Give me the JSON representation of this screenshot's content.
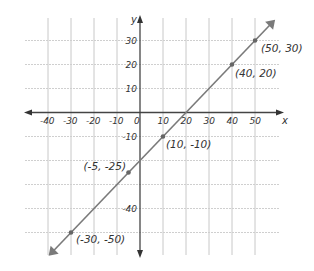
{
  "chart_data": {
    "type": "line",
    "title": "",
    "xlabel": "x",
    "ylabel": "y",
    "xlim": [
      -50,
      60
    ],
    "ylim": [
      -55,
      35
    ],
    "grid": true,
    "x_ticks": [
      -40,
      -30,
      -20,
      -10,
      0,
      10,
      20,
      30,
      40,
      50
    ],
    "x_tick_labels": [
      "-40",
      "-30",
      "-20",
      "-10",
      "0",
      "10",
      "20",
      "30",
      "40",
      "50"
    ],
    "y_ticks": [
      30,
      20,
      10,
      -10,
      -40
    ],
    "y_tick_labels": [
      "30",
      "20",
      "10",
      "-10",
      "-40"
    ],
    "series": [
      {
        "name": "line",
        "color": "#7a7a7a",
        "x": [
          -30,
          -5,
          10,
          40,
          50
        ],
        "y": [
          -50,
          -25,
          -10,
          20,
          30
        ]
      }
    ],
    "annotations": [
      {
        "text": "(50, 30)",
        "x": 50,
        "y": 30
      },
      {
        "text": "(40, 20)",
        "x": 40,
        "y": 20
      },
      {
        "text": "(10, -10)",
        "x": 10,
        "y": -10
      },
      {
        "text": "(-5, -25)",
        "x": -5,
        "y": -25
      },
      {
        "text": "(-30, -50)",
        "x": -30,
        "y": -50
      }
    ],
    "legend": null
  }
}
